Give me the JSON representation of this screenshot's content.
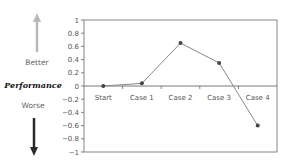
{
  "side_labels": {
    "better": "Better",
    "performance": "Performance",
    "worse": "Worse"
  },
  "colors": {
    "up_arrow": "#b8b8b8",
    "down_arrow": "#2a2a2a",
    "line": "#888888",
    "marker": "#444444",
    "axis": "#555555"
  },
  "chart_data": {
    "type": "line",
    "title": "",
    "xlabel": "",
    "ylabel": "Performance",
    "categories": [
      "Start",
      "Case 1",
      "Case 2",
      "Case 3",
      "Case 4"
    ],
    "series": [
      {
        "name": "Performance",
        "values": [
          0,
          0.04,
          0.65,
          0.35,
          -0.6
        ]
      }
    ],
    "ylim": [
      -1,
      1
    ],
    "yticks": [
      1,
      0.8,
      0.6,
      0.4,
      0.2,
      0,
      -0.2,
      -0.4,
      -0.6,
      -0.8,
      -1
    ],
    "ytick_labels": [
      "1",
      "0.8",
      "0.6",
      "0.4",
      "0.2",
      "0",
      "−0.2",
      "−0.4",
      "−0.6",
      "−0.8",
      "−1"
    ],
    "grid": false,
    "legend": "none",
    "annotations": [
      "Better (up arrow)",
      "Worse (down arrow)"
    ]
  }
}
